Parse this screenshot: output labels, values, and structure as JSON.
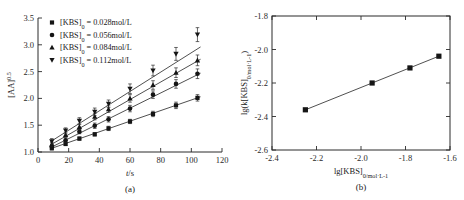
{
  "figure": {
    "panel_a_caption": "(a)",
    "panel_b_caption": "(b)"
  },
  "panel_a": {
    "xlabel_main": "t",
    "xlabel_rest": "/s",
    "ylabel_main": "[AA]",
    "ylabel_sup": "0.5",
    "xticks": [
      "0",
      "20",
      "40",
      "60",
      "80",
      "100",
      "120"
    ],
    "yticks": [
      "1.0",
      "1.5",
      "2.0",
      "2.5",
      "3.0",
      "3.5"
    ],
    "legend": [
      {
        "marker": "square-marker",
        "prefix": "[KBS]",
        "sub": "0",
        "value": " = 0.028mol/L"
      },
      {
        "marker": "circle-marker",
        "prefix": "[KBS]",
        "sub": "0",
        "value": " = 0.056mol/L"
      },
      {
        "marker": "triangle-up-marker",
        "prefix": "[KBS]",
        "sub": "0",
        "value": " = 0.084mol/L"
      },
      {
        "marker": "triangle-down-marker",
        "prefix": "[KBS]",
        "sub": "0",
        "value": " = 0.112mol/L"
      }
    ]
  },
  "panel_b": {
    "xlabel_prefix": "lg[KBS]",
    "xlabel_sub": "0/mol·L",
    "xlabel_sub_sup": "-1",
    "ylabel_prefix": "lg(k[KBS]",
    "ylabel_sub": "0/mol·L",
    "ylabel_sub_sup": "-1",
    "ylabel_suffix": ")",
    "xticks": [
      "-2.4",
      "-2.2",
      "-2.0",
      "-1.8",
      "-1.6"
    ],
    "yticks": [
      "-1.8",
      "-2.0",
      "-2.2",
      "-2.4",
      "-2.6"
    ]
  },
  "chart_data": [
    {
      "type": "scatter",
      "panel": "a",
      "title": "",
      "xlabel": "t/s",
      "ylabel": "[AA]^0.5",
      "xlim": [
        0,
        120
      ],
      "ylim": [
        1.0,
        3.5
      ],
      "grid": false,
      "legend_position": "upper-left",
      "series": [
        {
          "name": "[KBS]0 = 0.028mol/L",
          "marker": "square",
          "x": [
            9,
            18,
            27,
            37,
            46,
            60,
            75,
            90,
            104
          ],
          "y": [
            1.07,
            1.15,
            1.25,
            1.33,
            1.44,
            1.57,
            1.71,
            1.87,
            2.01
          ],
          "yerr": [
            0.03,
            0.03,
            0.03,
            0.03,
            0.04,
            0.04,
            0.05,
            0.06,
            0.06
          ],
          "fit_x": [
            8,
            106
          ],
          "fit_y": [
            1.06,
            2.03
          ]
        },
        {
          "name": "[KBS]0 = 0.056mol/L",
          "marker": "circle",
          "x": [
            9,
            18,
            27,
            37,
            46,
            60,
            75,
            90,
            104
          ],
          "y": [
            1.1,
            1.22,
            1.38,
            1.49,
            1.61,
            1.81,
            2.07,
            2.27,
            2.46
          ],
          "yerr": [
            0.04,
            0.04,
            0.04,
            0.05,
            0.05,
            0.06,
            0.07,
            0.08,
            0.09
          ],
          "fit_x": [
            8,
            106
          ],
          "fit_y": [
            1.08,
            2.47
          ]
        },
        {
          "name": "[KBS]0 = 0.084mol/L",
          "marker": "triangle-up",
          "x": [
            9,
            18,
            27,
            37,
            46,
            60,
            75,
            90,
            104
          ],
          "y": [
            1.14,
            1.32,
            1.47,
            1.66,
            1.8,
            2.0,
            2.25,
            2.48,
            2.71
          ],
          "yerr": [
            0.04,
            0.05,
            0.05,
            0.06,
            0.06,
            0.07,
            0.08,
            0.09,
            0.1
          ],
          "fit_x": [
            8,
            106
          ],
          "fit_y": [
            1.13,
            2.73
          ]
        },
        {
          "name": "[KBS]0 = 0.112mol/L",
          "marker": "triangle-down",
          "x": [
            9,
            18,
            27,
            37,
            46,
            60,
            75,
            90,
            104
          ],
          "y": [
            1.2,
            1.4,
            1.58,
            1.75,
            1.9,
            2.18,
            2.52,
            2.83,
            3.19
          ],
          "yerr": [
            0.05,
            0.05,
            0.06,
            0.07,
            0.07,
            0.09,
            0.1,
            0.12,
            0.13
          ],
          "fit_x": [
            8,
            106
          ],
          "fit_y": [
            1.19,
            2.96
          ]
        }
      ]
    },
    {
      "type": "scatter",
      "panel": "b",
      "title": "",
      "xlabel": "lg[KBS]0/mol·L-1",
      "ylabel": "lg(k[KBS]0/mol·L-1)",
      "xlim": [
        -2.4,
        -1.6
      ],
      "ylim": [
        -2.6,
        -1.8
      ],
      "grid": false,
      "series": [
        {
          "name": "fit",
          "marker": "square",
          "x": [
            -2.25,
            -1.95,
            -1.78,
            -1.65
          ],
          "y": [
            -2.36,
            -2.2,
            -2.11,
            -2.04
          ],
          "fit_x": [
            -2.25,
            -1.65
          ],
          "fit_y": [
            -2.36,
            -2.04
          ]
        }
      ]
    }
  ]
}
